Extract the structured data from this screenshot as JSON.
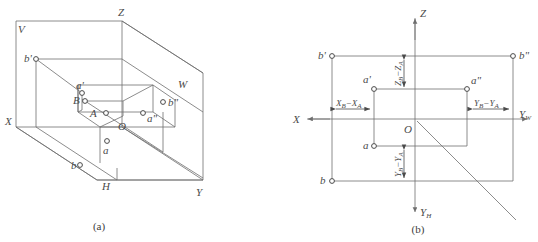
{
  "figure": {
    "captions": [
      {
        "key": "a",
        "text": "(a)"
      },
      {
        "key": "b",
        "text": "(b)"
      }
    ],
    "line_color": "#6e6e6e",
    "label_color": "#4a4a4a",
    "background": "#ffffff"
  },
  "diagram_a": {
    "name": "pictorial-three-plane-projection",
    "plane_labels": [
      {
        "id": "plane-v",
        "text": "V"
      },
      {
        "id": "plane-w",
        "text": "W"
      },
      {
        "id": "plane-h",
        "text": "H"
      }
    ],
    "axis_labels": [
      {
        "id": "axis-x",
        "text": "X"
      },
      {
        "id": "axis-y",
        "text": "Y"
      },
      {
        "id": "axis-z",
        "text": "Z"
      }
    ],
    "points": [
      {
        "id": "point-b-v",
        "text": "b'"
      },
      {
        "id": "point-a-v",
        "text": "a'"
      },
      {
        "id": "point-B",
        "text": "B"
      },
      {
        "id": "point-A",
        "text": "A"
      },
      {
        "id": "point-O",
        "text": "O"
      },
      {
        "id": "point-a-w",
        "text": "a\""
      },
      {
        "id": "point-b-w",
        "text": "b\""
      },
      {
        "id": "point-a-h",
        "text": "a"
      },
      {
        "id": "point-b-h",
        "text": "b"
      }
    ]
  },
  "diagram_b": {
    "name": "unfolded-projection-with-dimensions",
    "axis_labels": [
      {
        "id": "axis-x",
        "text": "X"
      },
      {
        "id": "axis-z",
        "text": "Z"
      },
      {
        "id": "axis-yw",
        "base": "Y",
        "sub": "W"
      },
      {
        "id": "axis-yh",
        "base": "Y",
        "sub": "H"
      }
    ],
    "origin_label": {
      "id": "origin",
      "text": "O"
    },
    "points": [
      {
        "id": "point-b-v",
        "text": "b'"
      },
      {
        "id": "point-b-w",
        "text": "b\""
      },
      {
        "id": "point-a-v",
        "text": "a'"
      },
      {
        "id": "point-a-w",
        "text": "a\""
      },
      {
        "id": "point-a-h",
        "text": "a"
      },
      {
        "id": "point-b-h",
        "text": "b"
      }
    ],
    "dimensions": [
      {
        "id": "dim-delta-x",
        "orientation": "horizontal",
        "minuend_base": "X",
        "minuend_sub": "B",
        "subtrahend_base": "X",
        "subtrahend_sub": "A",
        "text": "X_B−X_A"
      },
      {
        "id": "dim-delta-z",
        "orientation": "vertical",
        "minuend_base": "Z",
        "minuend_sub": "B",
        "subtrahend_base": "Z",
        "subtrahend_sub": "A",
        "text": "Z_B−Z_A"
      },
      {
        "id": "dim-delta-yw",
        "orientation": "horizontal",
        "minuend_base": "Y",
        "minuend_sub": "B",
        "subtrahend_base": "Y",
        "subtrahend_sub": "A",
        "text": "Y_B−Y_A"
      },
      {
        "id": "dim-delta-yh",
        "orientation": "vertical",
        "minuend_base": "Y",
        "minuend_sub": "B",
        "subtrahend_base": "Y",
        "subtrahend_sub": "A",
        "text": "Y_B−Y_A"
      }
    ]
  }
}
